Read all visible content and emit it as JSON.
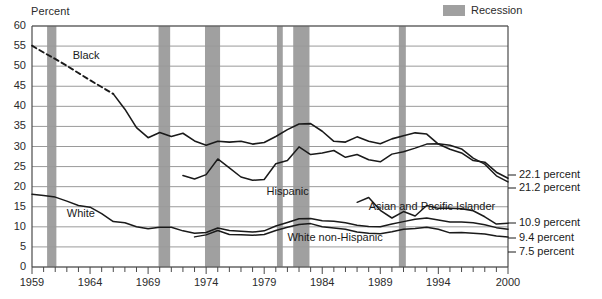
{
  "chart_data": {
    "type": "line",
    "title": "",
    "ylabel": "Percent",
    "xlabel": "",
    "ylim": [
      0,
      60
    ],
    "xlim": [
      1959,
      2000
    ],
    "yticks": [
      0,
      5,
      10,
      15,
      20,
      25,
      30,
      35,
      40,
      45,
      50,
      55,
      60
    ],
    "xticks_labeled": [
      1959,
      1964,
      1969,
      1974,
      1979,
      1984,
      1989,
      1994,
      2000
    ],
    "grid": "horizontal",
    "legend_position": "top-right",
    "legend": [
      {
        "label": "Recession",
        "color": "#a0a0a0",
        "type": "band"
      }
    ],
    "recessions": [
      {
        "start": 1960.3,
        "end": 1961.1
      },
      {
        "start": 1969.9,
        "end": 1970.9
      },
      {
        "start": 1973.9,
        "end": 1975.2
      },
      {
        "start": 1980.1,
        "end": 1980.6
      },
      {
        "start": 1981.5,
        "end": 1982.9
      },
      {
        "start": 1990.6,
        "end": 1991.2
      }
    ],
    "series": [
      {
        "name": "Black",
        "label": "Black",
        "label_x": 1962.5,
        "label_y": 52.5,
        "end_label": "22.1 percent",
        "style": "dashed-then-solid",
        "dashed_until": 1966,
        "x": [
          1959,
          1960,
          1961,
          1962,
          1963,
          1964,
          1965,
          1966,
          1967,
          1968,
          1969,
          1970,
          1971,
          1972,
          1973,
          1974,
          1975,
          1976,
          1977,
          1978,
          1979,
          1980,
          1981,
          1982,
          1983,
          1984,
          1985,
          1986,
          1987,
          1988,
          1989,
          1990,
          1991,
          1992,
          1993,
          1994,
          1995,
          1996,
          1997,
          1998,
          1999,
          2000
        ],
        "y": [
          55.1,
          53.4,
          51.8,
          50.1,
          48.3,
          46.5,
          44.8,
          43.1,
          39.3,
          34.7,
          32.2,
          33.5,
          32.5,
          33.3,
          31.4,
          30.3,
          31.3,
          31.1,
          31.3,
          30.6,
          31.0,
          32.5,
          34.2,
          35.6,
          35.7,
          33.8,
          31.3,
          31.1,
          32.4,
          31.3,
          30.7,
          31.9,
          32.7,
          33.4,
          33.1,
          30.6,
          29.3,
          28.4,
          26.5,
          26.1,
          23.6,
          22.1
        ]
      },
      {
        "name": "Hispanic",
        "label": "Hispanic",
        "label_x": 1979.2,
        "label_y": 18.6,
        "end_label": "21.2 percent",
        "style": "solid",
        "x": [
          1972,
          1973,
          1974,
          1975,
          1976,
          1977,
          1978,
          1979,
          1980,
          1981,
          1982,
          1983,
          1984,
          1985,
          1986,
          1987,
          1988,
          1989,
          1990,
          1991,
          1992,
          1993,
          1994,
          1995,
          1996,
          1997,
          1998,
          1999,
          2000
        ],
        "y": [
          22.8,
          21.9,
          23.0,
          26.9,
          24.7,
          22.4,
          21.6,
          21.8,
          25.7,
          26.5,
          29.9,
          28.0,
          28.4,
          29.0,
          27.3,
          28.0,
          26.7,
          26.2,
          28.1,
          28.7,
          29.6,
          30.6,
          30.7,
          30.3,
          29.4,
          27.1,
          25.6,
          22.7,
          21.2
        ]
      },
      {
        "name": "Asian and Pacific Islander",
        "label": "Asian and Pacific Islander",
        "label_x": 1988.0,
        "label_y": 15.0,
        "end_label": "10.9 percent",
        "style": "solid",
        "x": [
          1987,
          1988,
          1989,
          1990,
          1991,
          1992,
          1993,
          1994,
          1995,
          1996,
          1997,
          1998,
          1999,
          2000
        ],
        "y": [
          16.1,
          17.3,
          14.1,
          12.2,
          13.8,
          12.7,
          15.3,
          14.6,
          14.6,
          14.5,
          14.0,
          12.5,
          10.7,
          10.9
        ]
      },
      {
        "name": "White",
        "label": "White",
        "label_x": 1962.0,
        "label_y": 13.3,
        "end_label": "9.4 percent",
        "style": "solid",
        "x": [
          1959,
          1960,
          1961,
          1962,
          1963,
          1964,
          1965,
          1966,
          1967,
          1968,
          1969,
          1970,
          1971,
          1972,
          1973,
          1974,
          1975,
          1976,
          1977,
          1978,
          1979,
          1980,
          1981,
          1982,
          1983,
          1984,
          1985,
          1986,
          1987,
          1988,
          1989,
          1990,
          1991,
          1992,
          1993,
          1994,
          1995,
          1996,
          1997,
          1998,
          1999,
          2000
        ],
        "y": [
          18.1,
          17.8,
          17.4,
          16.4,
          15.3,
          14.9,
          13.3,
          11.3,
          11.0,
          10.0,
          9.5,
          9.9,
          9.9,
          9.0,
          8.4,
          8.6,
          9.7,
          9.1,
          8.9,
          8.7,
          9.0,
          10.2,
          11.1,
          12.0,
          12.1,
          11.5,
          11.4,
          11.0,
          10.4,
          10.1,
          10.0,
          10.7,
          11.3,
          11.9,
          12.2,
          11.7,
          11.2,
          11.2,
          11.0,
          10.5,
          9.8,
          9.4
        ]
      },
      {
        "name": "White non-Hispanic",
        "label": "White non-Hispanic",
        "label_x": 1981.0,
        "label_y": 7.1,
        "end_label": "7.5 percent",
        "style": "solid",
        "x": [
          1973,
          1974,
          1975,
          1976,
          1977,
          1978,
          1979,
          1980,
          1981,
          1982,
          1983,
          1984,
          1985,
          1986,
          1987,
          1988,
          1989,
          1990,
          1991,
          1992,
          1993,
          1994,
          1995,
          1996,
          1997,
          1998,
          1999,
          2000
        ],
        "y": [
          7.5,
          8.0,
          9.1,
          8.1,
          8.0,
          7.9,
          8.1,
          9.1,
          9.9,
          10.6,
          10.8,
          10.0,
          9.7,
          9.4,
          8.7,
          8.4,
          8.3,
          8.8,
          9.4,
          9.6,
          9.9,
          9.4,
          8.5,
          8.6,
          8.4,
          8.2,
          7.7,
          7.5
        ]
      }
    ]
  },
  "axis": {
    "y_label": "Percent",
    "y_tick_labels": [
      "0",
      "5",
      "10",
      "15",
      "20",
      "25",
      "30",
      "35",
      "40",
      "45",
      "50",
      "55",
      "60"
    ],
    "x_tick_labels": [
      "1959",
      "1964",
      "1969",
      "1974",
      "1979",
      "1984",
      "1989",
      "1994",
      "2000"
    ]
  },
  "legend": {
    "recession_label": "Recession"
  },
  "series_labels": {
    "black": "Black",
    "hispanic": "Hispanic",
    "asian": "Asian and Pacific Islander",
    "white": "White",
    "white_non_hispanic": "White non-Hispanic"
  },
  "end_labels": {
    "black": "22.1 percent",
    "hispanic": "21.2 percent",
    "asian": "10.9 percent",
    "white": "9.4 percent",
    "white_non_hispanic": "7.5 percent"
  },
  "colors": {
    "recession_band": "#a0a0a0",
    "line": "#1a1a1a",
    "grid": "#9a9a9a",
    "axis": "#4a4a4a",
    "text": "#1a1a1a"
  }
}
